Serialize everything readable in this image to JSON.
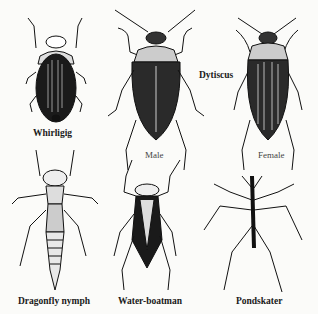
{
  "figure": {
    "background": "#fbfbf9",
    "ink": "#111111",
    "specimens": [
      {
        "id": "whirligig",
        "label": "Whirligig"
      },
      {
        "id": "dytiscus-male",
        "label": "Male"
      },
      {
        "id": "dytiscus-female",
        "label": "Female"
      },
      {
        "id": "dragonfly-nymph",
        "label": "Dragonfly nymph"
      },
      {
        "id": "water-boatman",
        "label": "Water-boatman"
      },
      {
        "id": "pondskater",
        "label": "Pondskater"
      }
    ],
    "group_label": "Dytiscus"
  }
}
